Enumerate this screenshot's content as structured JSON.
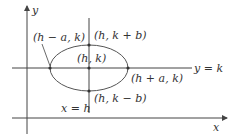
{
  "diagram": {
    "axes": {
      "x_label": "x",
      "y_label": "y"
    },
    "lines": {
      "horizontal_label": "y = k",
      "vertical_label": "x = h"
    },
    "points": {
      "left": "(h − a, k)",
      "top": "(h, k + b)",
      "center": "(h, k)",
      "right": "(h + a, k)",
      "bottom": "(h, k − b)"
    },
    "colors": {
      "stroke": "#444444",
      "text": "#333333",
      "background": "#ffffff"
    }
  }
}
